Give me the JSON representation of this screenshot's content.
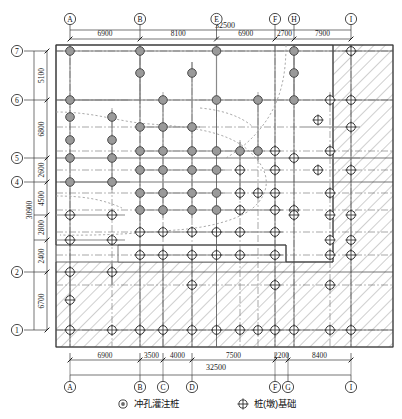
{
  "drawing": {
    "title": "Pile Foundation Layout Plan",
    "total_width_label": "32500",
    "total_height_label": "30900"
  },
  "top_axis": {
    "labels": [
      "A",
      "B",
      "E",
      "F",
      "H",
      "I"
    ],
    "positions": [
      70,
      140,
      216.5,
      275,
      294,
      351
    ],
    "dims": [
      "6900",
      "8100",
      "6900",
      "2700",
      "7900"
    ]
  },
  "bottom_axis": {
    "labels": [
      "A",
      "B",
      "C",
      "D",
      "F",
      "G",
      "I"
    ],
    "positions": [
      70,
      140,
      163,
      192,
      275,
      288,
      351
    ],
    "dims": [
      "6900",
      "3500",
      "4000",
      "7500",
      "2200",
      "8400"
    ]
  },
  "left_axis": {
    "labels": [
      "7",
      "6",
      "5",
      "4",
      "2",
      "1"
    ],
    "positions": [
      51,
      100,
      158,
      182,
      272,
      330
    ],
    "dims": [
      "5100",
      "6800",
      "2600",
      "4500",
      "2800",
      "2400",
      "6700"
    ],
    "dim_spans": [
      [
        51,
        100
      ],
      [
        100,
        158
      ],
      [
        158,
        182
      ],
      [
        182,
        215
      ],
      [
        215,
        240
      ],
      [
        240,
        272
      ],
      [
        272,
        330
      ]
    ]
  },
  "legend": {
    "items": [
      {
        "symbol": "bored-pile-symbol",
        "label": "冲孔灌注桩"
      },
      {
        "symbol": "pier-foundation-symbol",
        "label": "桩(墩)基础"
      }
    ]
  },
  "colors": {
    "line": "#3b3b3b",
    "filled_pile": "#9a9a9a",
    "filled_pile_stroke": "#4a4a4a",
    "open_pile_stroke": "#2b2b2b",
    "hatch": "#8e8e8e",
    "dash_outline": "#9b9b9b",
    "centerline": "#6b6b6b"
  },
  "piles": {
    "filled": [
      [
        70,
        51
      ],
      [
        140,
        51
      ],
      [
        216.5,
        51
      ],
      [
        294,
        51
      ],
      [
        140,
        73
      ],
      [
        192,
        73
      ],
      [
        294,
        73
      ],
      [
        70,
        100
      ],
      [
        163,
        100
      ],
      [
        216.5,
        100
      ],
      [
        258,
        100
      ],
      [
        294,
        100
      ],
      [
        70,
        117
      ],
      [
        112,
        117
      ],
      [
        140,
        127
      ],
      [
        163,
        127
      ],
      [
        192,
        127
      ],
      [
        70,
        140
      ],
      [
        112,
        140
      ],
      [
        140,
        151
      ],
      [
        163,
        151
      ],
      [
        192,
        151
      ],
      [
        216.5,
        151
      ],
      [
        240,
        151
      ],
      [
        258,
        151
      ],
      [
        70,
        158
      ],
      [
        112,
        158
      ],
      [
        140,
        170
      ],
      [
        163,
        170
      ],
      [
        192,
        170
      ],
      [
        216.5,
        170
      ],
      [
        70,
        182
      ],
      [
        112,
        182
      ],
      [
        140,
        193
      ],
      [
        163,
        193
      ],
      [
        192,
        193
      ],
      [
        216.5,
        193
      ],
      [
        140,
        210
      ],
      [
        163,
        210
      ],
      [
        192,
        210
      ],
      [
        216.5,
        210
      ]
    ],
    "open": [
      [
        351,
        51
      ],
      [
        330,
        100
      ],
      [
        351,
        100
      ],
      [
        318,
        120
      ],
      [
        351,
        127
      ],
      [
        330,
        151
      ],
      [
        294,
        158
      ],
      [
        275,
        151
      ],
      [
        318,
        170
      ],
      [
        351,
        170
      ],
      [
        330,
        193
      ],
      [
        275,
        170
      ],
      [
        240,
        170
      ],
      [
        258,
        193
      ],
      [
        240,
        193
      ],
      [
        275,
        193
      ],
      [
        70,
        215
      ],
      [
        112,
        215
      ],
      [
        240,
        210
      ],
      [
        275,
        210
      ],
      [
        294,
        210
      ],
      [
        140,
        232
      ],
      [
        163,
        232
      ],
      [
        192,
        232
      ],
      [
        216.5,
        232
      ],
      [
        240,
        232
      ],
      [
        275,
        232
      ],
      [
        294,
        215
      ],
      [
        330,
        215
      ],
      [
        351,
        215
      ],
      [
        70,
        240
      ],
      [
        112,
        240
      ],
      [
        330,
        240
      ],
      [
        351,
        240
      ],
      [
        140,
        255
      ],
      [
        163,
        255
      ],
      [
        192,
        255
      ],
      [
        216.5,
        255
      ],
      [
        240,
        255
      ],
      [
        275,
        255
      ],
      [
        330,
        255
      ],
      [
        351,
        255
      ],
      [
        70,
        272
      ],
      [
        112,
        272
      ],
      [
        192,
        285
      ],
      [
        275,
        285
      ],
      [
        330,
        285
      ],
      [
        70,
        300
      ],
      [
        70,
        330
      ],
      [
        112,
        330
      ],
      [
        140,
        330
      ],
      [
        163,
        330
      ],
      [
        192,
        330
      ],
      [
        216.5,
        330
      ],
      [
        240,
        330
      ],
      [
        258,
        330
      ],
      [
        275,
        330
      ],
      [
        294,
        330
      ],
      [
        330,
        330
      ],
      [
        351,
        330
      ]
    ]
  }
}
